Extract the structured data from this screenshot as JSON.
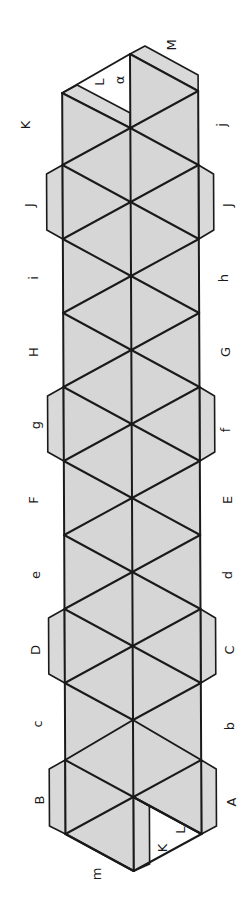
{
  "diagram": {
    "colors": {
      "face": "#d6d6d6",
      "line": "#1a1a1a",
      "background": "#ffffff"
    },
    "grid": {
      "left_x": 62,
      "center_x": 130,
      "right_x": 198,
      "side_vertex_y": [
        165,
        239,
        313,
        387,
        461,
        535,
        609,
        683,
        760,
        834
      ],
      "center_vertex_y": [
        54,
        128,
        202,
        276,
        350,
        424,
        498,
        572,
        646,
        720,
        797,
        871
      ]
    },
    "labels": {
      "left": [
        {
          "text": "K",
          "x": 26,
          "y": 125
        },
        {
          "text": "J",
          "x": 30,
          "y": 205
        },
        {
          "text": "i",
          "x": 34,
          "y": 278
        },
        {
          "text": "H",
          "x": 34,
          "y": 352
        },
        {
          "text": "g",
          "x": 36,
          "y": 425
        },
        {
          "text": "F",
          "x": 34,
          "y": 500
        },
        {
          "text": "e",
          "x": 36,
          "y": 575
        },
        {
          "text": "D",
          "x": 36,
          "y": 650
        },
        {
          "text": "c",
          "x": 38,
          "y": 724
        },
        {
          "text": "B",
          "x": 40,
          "y": 800
        }
      ],
      "right": [
        {
          "text": "j",
          "x": 222,
          "y": 125
        },
        {
          "text": "J",
          "x": 228,
          "y": 205
        },
        {
          "text": "h",
          "x": 224,
          "y": 278
        },
        {
          "text": "G",
          "x": 226,
          "y": 352
        },
        {
          "text": "f",
          "x": 226,
          "y": 430
        },
        {
          "text": "E",
          "x": 228,
          "y": 500
        },
        {
          "text": "d",
          "x": 228,
          "y": 575
        },
        {
          "text": "C",
          "x": 230,
          "y": 650
        },
        {
          "text": "b",
          "x": 230,
          "y": 726
        },
        {
          "text": "A",
          "x": 232,
          "y": 802
        }
      ],
      "top": [
        {
          "text": "L",
          "x": 100,
          "y": 82
        },
        {
          "text": "α",
          "x": 120,
          "y": 80
        },
        {
          "text": "M",
          "x": 172,
          "y": 45
        }
      ],
      "bottom": [
        {
          "text": "m",
          "x": 97,
          "y": 874
        },
        {
          "text": "K",
          "x": 163,
          "y": 848
        },
        {
          "text": "L",
          "x": 181,
          "y": 830
        }
      ]
    }
  }
}
